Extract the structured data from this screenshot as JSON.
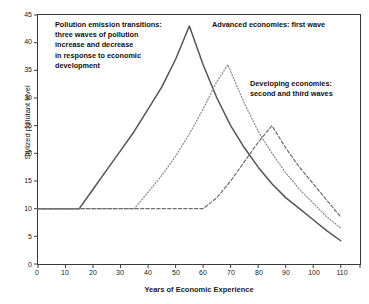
{
  "chart_data": {
    "type": "line",
    "title": "",
    "xlabel": "Years of Economic Experience",
    "ylabel": "Stylized pollutant level",
    "xlim": [
      0,
      117
    ],
    "ylim": [
      0,
      45
    ],
    "xticks": [
      0,
      10,
      20,
      30,
      40,
      50,
      60,
      70,
      80,
      90,
      100,
      110
    ],
    "yticks": [
      0,
      5,
      10,
      15,
      20,
      25,
      30,
      35,
      40,
      45
    ],
    "grid": false,
    "legend": "none",
    "baseline_value": 10,
    "series": [
      {
        "name": "Advanced economies: first wave",
        "style": "solid",
        "color": "#555555",
        "peak_x": 55,
        "peak_y": 43,
        "x": [
          0,
          10,
          15,
          20,
          25,
          30,
          35,
          40,
          45,
          50,
          55,
          60,
          65,
          70,
          75,
          80,
          85,
          90,
          95,
          100,
          105,
          110
        ],
        "y": [
          10,
          10,
          10,
          13.5,
          17,
          20.5,
          24,
          28,
          32,
          37,
          43,
          36,
          30,
          25,
          21,
          17.5,
          14.5,
          12,
          10,
          8,
          6,
          4.2
        ]
      },
      {
        "name": "Developing economies: second wave",
        "style": "dotted",
        "color": "#8a8a8a",
        "peak_x": 69,
        "peak_y": 36,
        "x": [
          0,
          10,
          20,
          30,
          35,
          40,
          45,
          50,
          55,
          60,
          65,
          69,
          75,
          80,
          85,
          90,
          95,
          100,
          105,
          110
        ],
        "y": [
          10,
          10,
          10,
          10,
          10,
          13,
          16,
          19.5,
          23.5,
          28,
          33,
          36,
          29,
          24,
          20,
          16.5,
          13.5,
          11,
          8.5,
          6.5
        ]
      },
      {
        "name": "Developing economies: third wave",
        "style": "dashed",
        "color": "#6e6e6e",
        "peak_x": 85,
        "peak_y": 25,
        "x": [
          0,
          10,
          20,
          30,
          40,
          50,
          60,
          65,
          70,
          75,
          80,
          85,
          90,
          95,
          100,
          105,
          110
        ],
        "y": [
          10,
          10,
          10,
          10,
          10,
          10,
          10,
          12,
          15,
          18.5,
          22,
          25,
          21,
          17.5,
          14.5,
          11.5,
          8.5
        ]
      }
    ],
    "annotations": [
      {
        "name": "pollution-transitions-note",
        "text": "Pollution emission transitions:\nthree waves of pollution\nincrease and decrease\nin response to economic\ndevelopment"
      },
      {
        "name": "advanced-economies-label",
        "text": "Advanced economies: first wave"
      },
      {
        "name": "developing-economies-label",
        "text": "Developing economies:\nsecond and third waves"
      }
    ]
  }
}
